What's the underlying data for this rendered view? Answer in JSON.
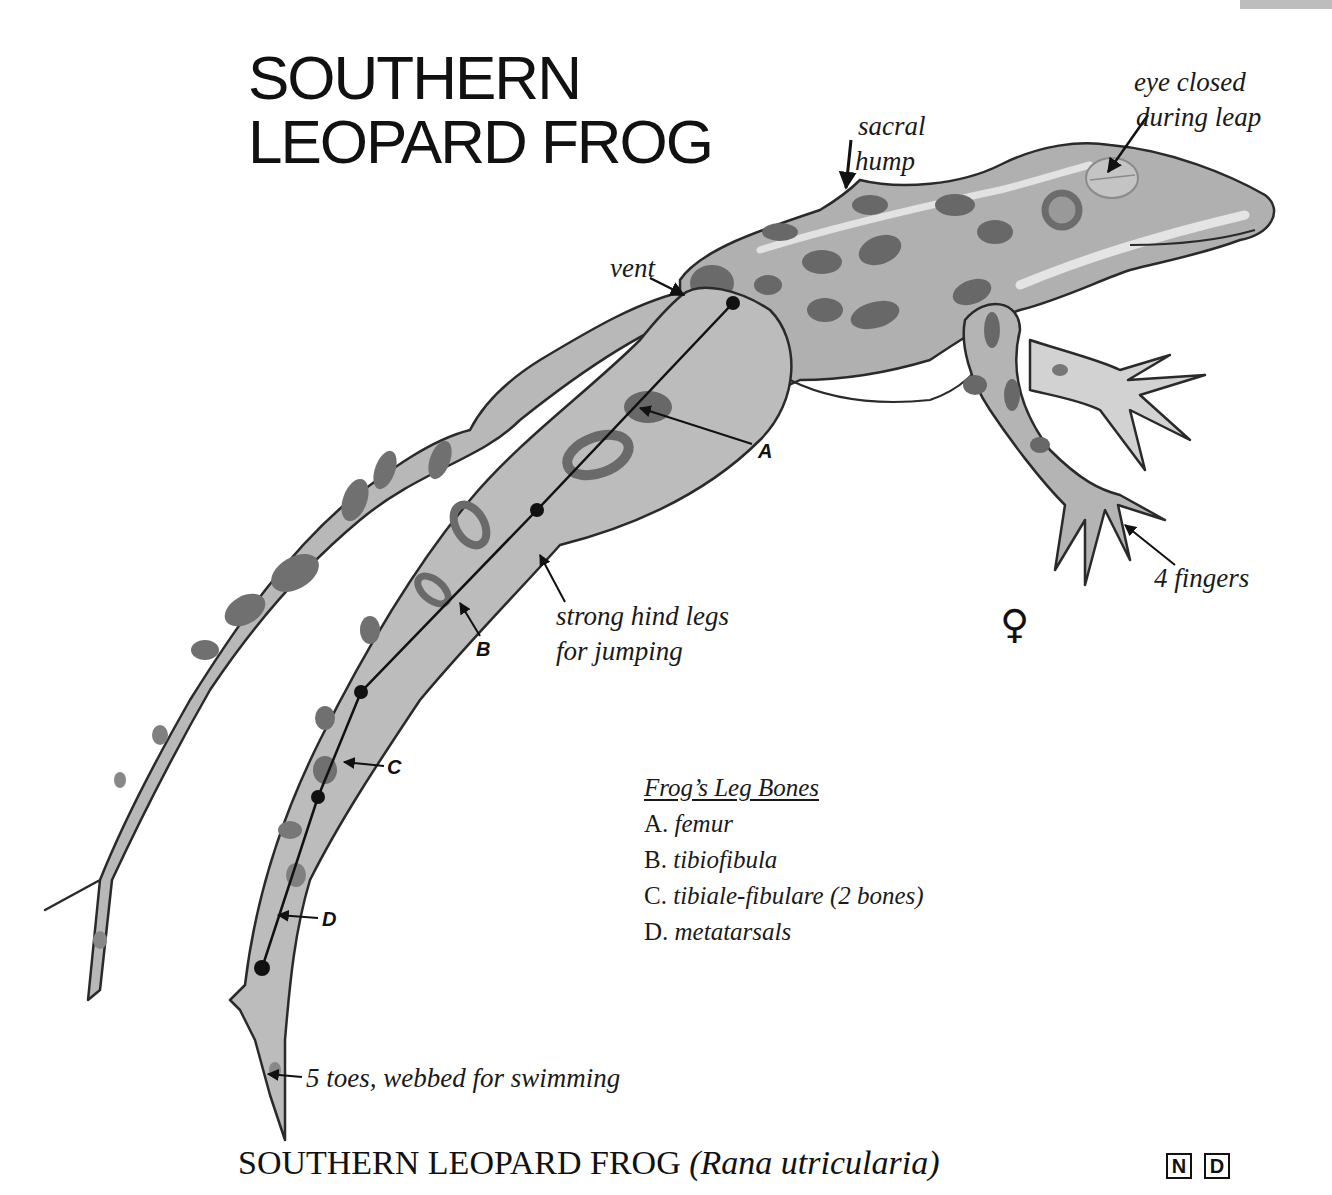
{
  "header": {
    "title_line1": "SOUTHERN",
    "title_line2": "LEOPARD FROG"
  },
  "annotations": {
    "eye": [
      "eye closed",
      "during leap"
    ],
    "sacral": [
      "sacral",
      "hump"
    ],
    "vent": "vent",
    "hind_legs": [
      "strong hind legs",
      "for jumping"
    ],
    "fingers": "4 fingers",
    "toes": "5 toes, webbed for swimming",
    "sex_symbol": "♀"
  },
  "bone_markers": {
    "a": "A",
    "b": "B",
    "c": "C",
    "d": "D"
  },
  "legend": {
    "title": "Frog’s Leg Bones",
    "items": [
      {
        "key": "A.",
        "label": "femur"
      },
      {
        "key": "B.",
        "label": "tibiofibula"
      },
      {
        "key": "C.",
        "label": "tibiale-fibulare (2 bones)"
      },
      {
        "key": "D.",
        "label": "metatarsals"
      }
    ]
  },
  "caption": {
    "common_name": "SOUTHERN LEOPARD FROG",
    "scientific_name": "(Rana utricularia)"
  },
  "badges": [
    "N",
    "D"
  ],
  "colors": {
    "skin": "#b4b4b4",
    "skin_light": "#cfcfcf",
    "spots": "#6e6e6e",
    "outline": "#2a2a2a",
    "belly": "#ffffff",
    "strip": "#bdbdbd"
  }
}
